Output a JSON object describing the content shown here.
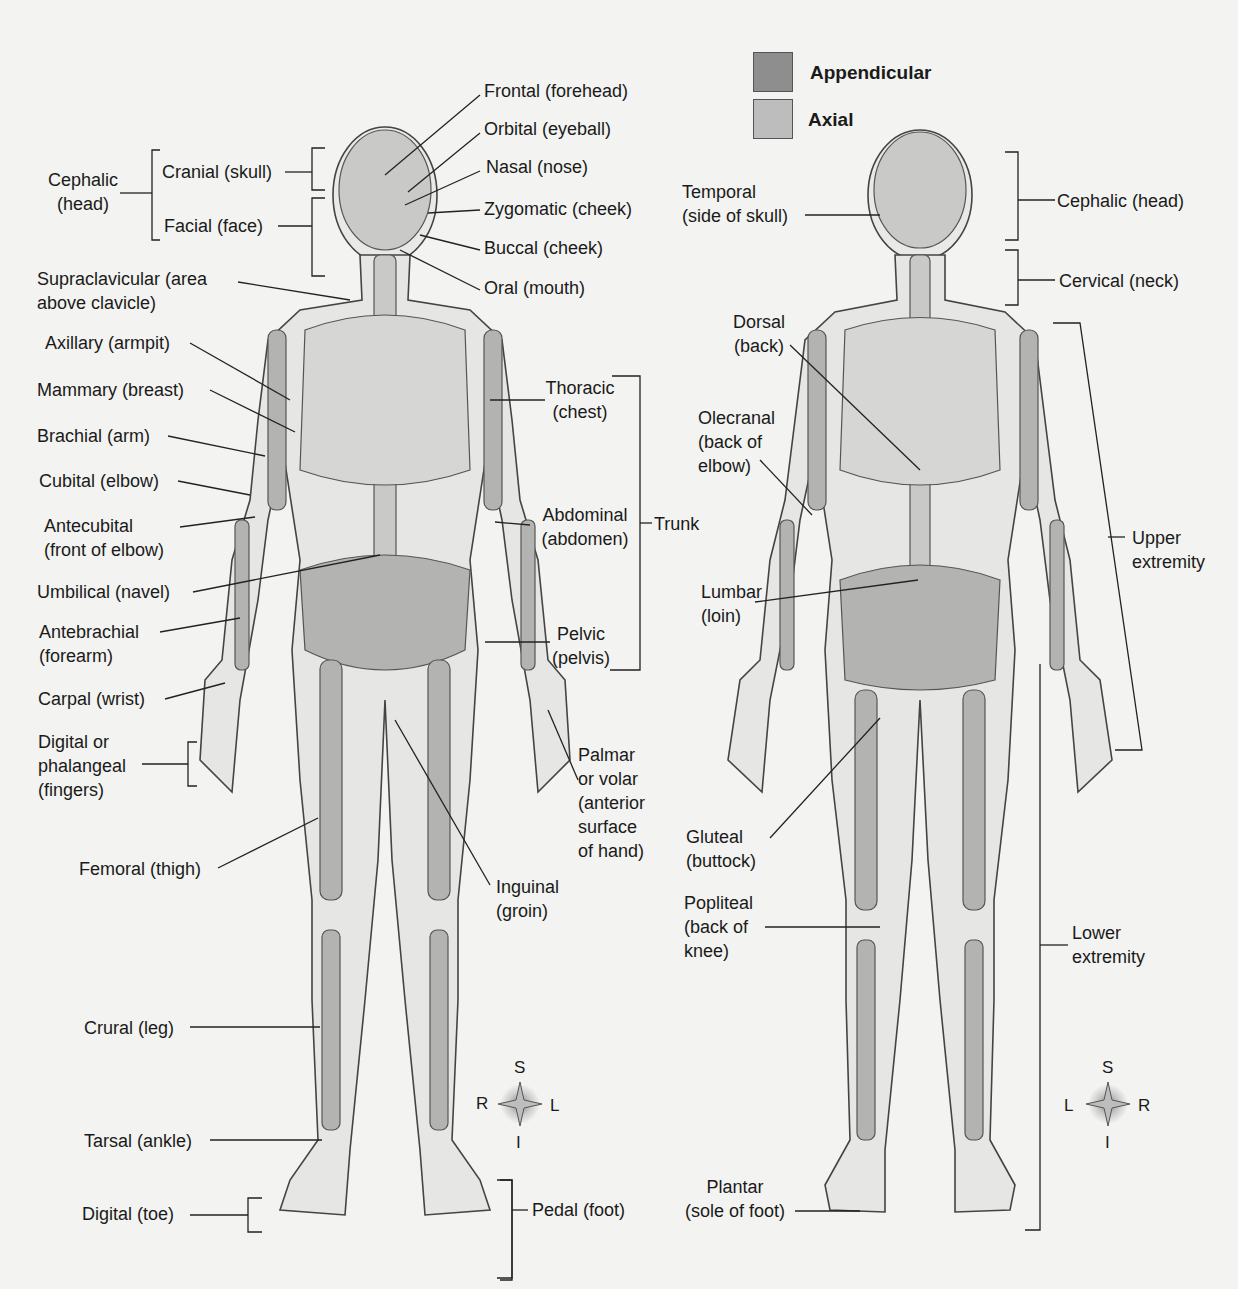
{
  "legend": {
    "items": [
      {
        "label": "Appendicular",
        "color": "#8e8e8e"
      },
      {
        "label": "Axial",
        "color": "#bdbdbd"
      }
    ]
  },
  "anterior": {
    "labels": {
      "frontal": "Frontal (forehead)",
      "orbital": "Orbital (eyeball)",
      "nasal": "Nasal (nose)",
      "zygomatic": "Zygomatic (cheek)",
      "buccal": "Buccal (cheek)",
      "oral": "Oral (mouth)",
      "cephalic_1": "Cephalic",
      "cephalic_2": "(head)",
      "cranial": "Cranial (skull)",
      "facial": "Facial (face)",
      "supraclavicular_1": "Supraclavicular (area",
      "supraclavicular_2": "above clavicle)",
      "axillary": "Axillary (armpit)",
      "mammary": "Mammary (breast)",
      "brachial": "Brachial (arm)",
      "cubital": "Cubital (elbow)",
      "antecubital_1": "Antecubital",
      "antecubital_2": "(front of elbow)",
      "umbilical": "Umbilical (navel)",
      "antebrachial_1": "Antebrachial",
      "antebrachial_2": "(forearm)",
      "carpal": "Carpal (wrist)",
      "digital_1": "Digital or",
      "digital_2": "phalangeal",
      "digital_3": "(fingers)",
      "femoral": "Femoral (thigh)",
      "crural": "Crural (leg)",
      "tarsal": "Tarsal (ankle)",
      "digital_toe": "Digital (toe)",
      "thoracic_1": "Thoracic",
      "thoracic_2": "(chest)",
      "abdominal_1": "Abdominal",
      "abdominal_2": "(abdomen)",
      "trunk": "Trunk",
      "pelvic_1": "Pelvic",
      "pelvic_2": "(pelvis)",
      "palmar_1": "Palmar",
      "palmar_2": "or volar",
      "palmar_3": "(anterior",
      "palmar_4": "surface",
      "palmar_5": "of hand)",
      "inguinal_1": "Inguinal",
      "inguinal_2": "(groin)",
      "pedal": "Pedal (foot)"
    },
    "compass": {
      "top": "S",
      "bottom": "I",
      "left": "R",
      "right": "L"
    }
  },
  "posterior": {
    "labels": {
      "temporal_1": "Temporal",
      "temporal_2": "(side of skull)",
      "cephalic": "Cephalic (head)",
      "cervical": "Cervical (neck)",
      "dorsal_1": "Dorsal",
      "dorsal_2": "(back)",
      "olecranal_1": "Olecranal",
      "olecranal_2": "(back of",
      "olecranal_3": "elbow)",
      "upper_1": "Upper",
      "upper_2": "extremity",
      "lumbar_1": "Lumbar",
      "lumbar_2": "(loin)",
      "gluteal_1": "Gluteal",
      "gluteal_2": "(buttock)",
      "popliteal_1": "Popliteal",
      "popliteal_2": "(back of",
      "popliteal_3": "knee)",
      "lower_1": "Lower",
      "lower_2": "extremity",
      "plantar_1": "Plantar",
      "plantar_2": "(sole of foot)"
    },
    "compass": {
      "top": "S",
      "bottom": "I",
      "left": "L",
      "right": "R"
    }
  }
}
